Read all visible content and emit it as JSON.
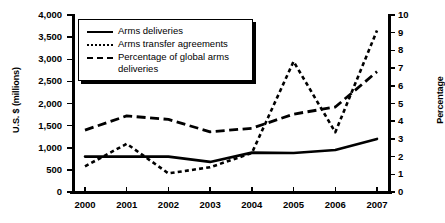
{
  "chart_data": {
    "type": "line",
    "title": "",
    "xlabel": "",
    "ylabel": "U.S. $ (millions)",
    "ylabel_right": "Percentage",
    "categories": [
      "2000",
      "2001",
      "2002",
      "2003",
      "2004",
      "2005",
      "2006",
      "2007"
    ],
    "x": [
      2000,
      2001,
      2002,
      2003,
      2004,
      2005,
      2006,
      2007
    ],
    "ylim": [
      0,
      4000
    ],
    "ylim_right": [
      0,
      10
    ],
    "yticks": [
      "0",
      "500",
      "1,000",
      "1,500",
      "2,000",
      "2,500",
      "3,000",
      "3,500",
      "4,000"
    ],
    "ytick_values": [
      0,
      500,
      1000,
      1500,
      2000,
      2500,
      3000,
      3500,
      4000
    ],
    "yticks_right": [
      "0",
      "1",
      "2",
      "3",
      "4",
      "5",
      "6",
      "7",
      "8",
      "9",
      "10"
    ],
    "ytick_values_right": [
      0,
      1,
      2,
      3,
      4,
      5,
      6,
      7,
      8,
      9,
      10
    ],
    "grid": false,
    "legend_position": "top-left",
    "series": [
      {
        "name": "Arms deliveries",
        "style": "solid",
        "axis": "left",
        "values": [
          800,
          800,
          800,
          680,
          890,
          880,
          950,
          1200
        ]
      },
      {
        "name": "Arms transfer agreements",
        "style": "dotted",
        "axis": "left",
        "values": [
          580,
          1090,
          420,
          560,
          880,
          2950,
          1350,
          3650
        ]
      },
      {
        "name": "Percentage of global arms deliveries",
        "style": "dashed",
        "axis": "right",
        "values": [
          3.5,
          4.3,
          4.1,
          3.4,
          3.6,
          4.4,
          4.8,
          6.8
        ]
      }
    ]
  },
  "legend": {
    "items": [
      {
        "label": "Arms deliveries",
        "style": "solid"
      },
      {
        "label": "Arms transfer agreements",
        "style": "dotted"
      },
      {
        "label": "Percentage of global arms deliveries",
        "style": "dashed"
      }
    ]
  },
  "colors": {
    "line": "#000000",
    "background": "#ffffff",
    "axis": "#000000"
  }
}
